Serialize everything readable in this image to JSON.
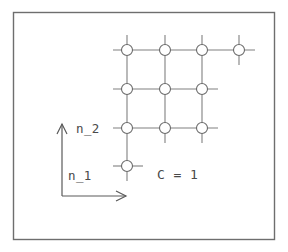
{
  "figure": {
    "kind": "lattice-diagram",
    "background_color": "#ffffff",
    "frame": {
      "x": 13,
      "y": 12,
      "width": 262,
      "height": 228,
      "stroke_color": "#6e6e6e"
    },
    "labels": {
      "vertical_axis": "n_2",
      "horizontal_axis": "n_1",
      "annotation": "C = 1"
    },
    "axes": {
      "origin_x": 62,
      "origin_y": 196,
      "vertical_top_y": 124,
      "horizontal_right_x": 126,
      "stroke_color": "#5a5a5a"
    },
    "lattice": {
      "node_color": "#6a6a6a",
      "line_color": "#808080",
      "node_radius": 5.5,
      "column_x": [
        127,
        165,
        202,
        239
      ],
      "row_y": [
        50,
        89,
        128,
        166
      ],
      "rows": [
        {
          "index": 0,
          "node_count": 4,
          "label": "top-row"
        },
        {
          "index": 1,
          "node_count": 3,
          "label": "second-row"
        },
        {
          "index": 2,
          "node_count": 3,
          "label": "third-row"
        },
        {
          "index": 3,
          "node_count": 1,
          "label": "bottom-row"
        }
      ],
      "columns": [
        {
          "index": 0,
          "node_count": 4
        },
        {
          "index": 1,
          "node_count": 3
        },
        {
          "index": 2,
          "node_count": 3
        },
        {
          "index": 3,
          "node_count": 1
        }
      ]
    }
  }
}
